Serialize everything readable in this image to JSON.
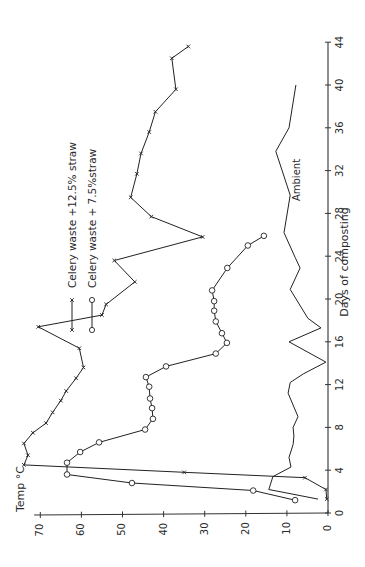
{
  "chart_data": {
    "type": "line",
    "orientation": "rotated-90-ccw",
    "title": "",
    "xlabel": "Days of composting",
    "ylabel": "Temp °C",
    "xlim": [
      0,
      44
    ],
    "ylim": [
      0,
      75
    ],
    "x_ticks": [
      0,
      4,
      8,
      12,
      16,
      20,
      24,
      28,
      32,
      36,
      40,
      44
    ],
    "y_ticks": [
      0,
      10,
      20,
      30,
      40,
      50,
      60,
      70
    ],
    "grid": false,
    "legend_position": "upper-left (in rotated view)",
    "series": [
      {
        "name": "Celery waste +12.5% straw",
        "marker": "x",
        "points": [
          [
            1.3,
            0.3
          ],
          [
            2.2,
            0.5
          ],
          [
            3.3,
            5.6
          ],
          [
            3.8,
            35
          ],
          [
            4.5,
            74
          ],
          [
            5.4,
            73
          ],
          [
            6.5,
            74
          ],
          [
            7.5,
            71.8
          ],
          [
            8.4,
            68.6
          ],
          [
            9.4,
            67
          ],
          [
            10.5,
            65
          ],
          [
            11.4,
            63.7
          ],
          [
            12.6,
            61.3
          ],
          [
            13.6,
            59.5
          ],
          [
            15.4,
            60.5
          ],
          [
            17.4,
            70.5
          ],
          [
            18.5,
            55
          ],
          [
            19.5,
            54
          ],
          [
            21.6,
            47
          ],
          [
            23.6,
            52
          ],
          [
            25.8,
            30.5
          ],
          [
            27.7,
            43
          ],
          [
            29.5,
            48
          ],
          [
            31.7,
            46.5
          ],
          [
            33.6,
            45.5
          ],
          [
            35.6,
            43.5
          ],
          [
            37.5,
            42
          ],
          [
            39.6,
            37
          ],
          [
            42.5,
            38
          ],
          [
            43.6,
            34
          ]
        ]
      },
      {
        "name": "Celery waste + 7.5%straw",
        "marker": "o",
        "points": [
          [
            1.2,
            8
          ],
          [
            2.1,
            18.2
          ],
          [
            2.8,
            47.7
          ],
          [
            3.6,
            63.5
          ],
          [
            4.7,
            63.5
          ],
          [
            5.7,
            60.3
          ],
          [
            6.6,
            55.7
          ],
          [
            7.8,
            44.5
          ],
          [
            8.8,
            42.6
          ],
          [
            9.8,
            42.8
          ],
          [
            10.7,
            43.3
          ],
          [
            11.8,
            43.5
          ],
          [
            12.7,
            44.3
          ],
          [
            13.7,
            39.4
          ],
          [
            14.9,
            27.3
          ],
          [
            15.9,
            24.6
          ],
          [
            16.8,
            25.8
          ],
          [
            17.9,
            27.3
          ],
          [
            18.9,
            27.7
          ],
          [
            19.8,
            27.7
          ],
          [
            20.8,
            28.2
          ],
          [
            22.9,
            24.5
          ],
          [
            25.0,
            19.5
          ],
          [
            25.9,
            15.6
          ]
        ]
      },
      {
        "name": "Ambient",
        "marker": "none",
        "points": [
          [
            1.3,
            2.4
          ],
          [
            2.2,
            14.4
          ],
          [
            3.4,
            13.4
          ],
          [
            4.3,
            9
          ],
          [
            5.2,
            9.5
          ],
          [
            6.4,
            8.5
          ],
          [
            7.2,
            8.3
          ],
          [
            8.0,
            8.5
          ],
          [
            9.0,
            7.3
          ],
          [
            11.2,
            9.7
          ],
          [
            12.2,
            9.2
          ],
          [
            13.0,
            6
          ],
          [
            14.1,
            0.5
          ],
          [
            16.0,
            9.5
          ],
          [
            17.3,
            1.7
          ],
          [
            18.2,
            4.9
          ],
          [
            20.9,
            9.2
          ],
          [
            22.9,
            6.8
          ],
          [
            23.9,
            8
          ],
          [
            26.2,
            10.7
          ],
          [
            29.7,
            9.2
          ],
          [
            33.8,
            12.7
          ],
          [
            36.0,
            9.5
          ],
          [
            40.0,
            7.8
          ]
        ]
      }
    ],
    "annotations": [
      {
        "text": "Ambient",
        "x": 29,
        "y": 14
      }
    ]
  },
  "labels": {
    "y_axis_title": "Temp °C",
    "x_axis_title": "Days of composting",
    "legend": [
      {
        "label": "Celery waste +12.5% straw",
        "marker": "x"
      },
      {
        "label": "Celery waste + 7.5%straw",
        "marker": "o"
      }
    ],
    "ambient_label": "Ambient"
  }
}
